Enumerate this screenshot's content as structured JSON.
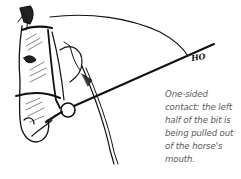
{
  "figure": {
    "signature": "HO",
    "caption_lines": [
      "One-sided",
      "contact: the left",
      "half of the bit is",
      "being pulled out",
      "of the horse's",
      "mouth."
    ],
    "colors": {
      "ink": "#111111",
      "caption": "#5a5a5a",
      "background": "#ffffff"
    }
  }
}
